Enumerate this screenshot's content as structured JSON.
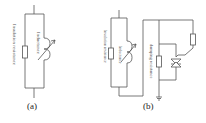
{
  "figure_a": {
    "caption": "(a)",
    "labels": {
      "insulation_resistance": "Insulation resistance",
      "inductance": "Inductance"
    }
  },
  "figure_b": {
    "caption": "(b)",
    "labels": {
      "insulation_resistance": "Insulation resistance",
      "inductance": "Inductance",
      "damping_resistance": "damping resistance"
    }
  },
  "colors": {
    "line": "#555555",
    "background": "#ffffff"
  }
}
